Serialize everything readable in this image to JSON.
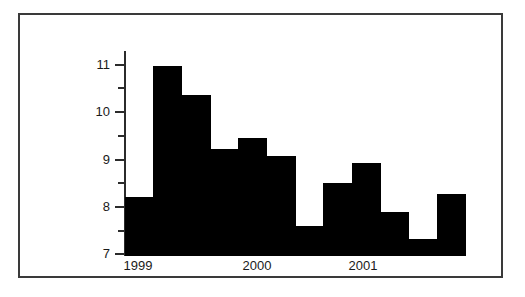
{
  "figure": {
    "frame_color": "#3a3a3a",
    "background_color": "#ffffff",
    "bar_color": "#000000",
    "axis_color": "#2b2b2b"
  },
  "axes": {
    "y_tick_labels": [
      "11",
      "10",
      "9",
      "8",
      "7"
    ],
    "y_tick_values": [
      11,
      10,
      9,
      8,
      7
    ],
    "y_minor_tick_values": [
      10.5,
      9.5,
      8.5,
      7.5
    ],
    "x_tick_labels": [
      "1999",
      "2000",
      "2001"
    ],
    "x_tick_values": [
      1999,
      2000,
      2001
    ]
  },
  "chart_data": {
    "type": "bar",
    "title": "",
    "subtitle": "",
    "xlabel": "",
    "ylabel": "",
    "xlim": [
      1999.0,
      2002.0
    ],
    "ylim": [
      7,
      11.45
    ],
    "grid": false,
    "legend": null,
    "bar_color": "#000000",
    "categories": [
      "1999 Q1",
      "1999 Q2",
      "1999 Q3",
      "1999 Q4",
      "2000 Q1",
      "2000 Q2",
      "2000 Q3",
      "2000 Q4",
      "2001 Q1",
      "2001 Q2",
      "2001 Q3",
      "2001 Q4"
    ],
    "x": [
      1999.0,
      1999.25,
      1999.5,
      1999.75,
      2000.0,
      2000.25,
      2000.5,
      2000.75,
      2001.0,
      2001.25,
      2001.5,
      2001.75
    ],
    "values": [
      8.3,
      11.2,
      10.55,
      9.35,
      9.6,
      9.2,
      7.65,
      8.6,
      9.05,
      7.95,
      7.35,
      8.35
    ],
    "series": [
      {
        "name": "series-1",
        "values": [
          8.3,
          11.2,
          10.55,
          9.35,
          9.6,
          9.2,
          7.65,
          8.6,
          9.05,
          7.95,
          7.35,
          8.35
        ]
      }
    ],
    "bar_width_fraction": 1.0,
    "annotations": []
  }
}
